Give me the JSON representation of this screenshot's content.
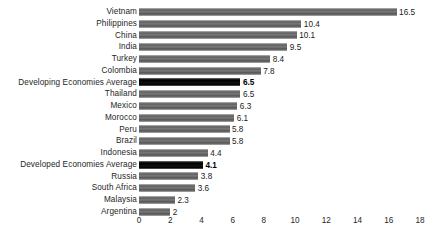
{
  "chart_data": {
    "type": "bar",
    "orientation": "horizontal",
    "title": "",
    "subtitle": "",
    "xlabel": "",
    "ylabel": "",
    "xlim": [
      0,
      18
    ],
    "xticks": [
      0,
      2,
      4,
      6,
      8,
      10,
      12,
      14,
      16,
      18
    ],
    "xtick_labels": [
      "0",
      "2",
      "4",
      "6",
      "8",
      "10",
      "12",
      "14",
      "16",
      "18"
    ],
    "grid": false,
    "legend": null,
    "categories": [
      "Vietnam",
      "Philippines",
      "China",
      "India",
      "Turkey",
      "Colombia",
      "Developing Economies Average",
      "Thailand",
      "Mexico",
      "Morocco",
      "Peru",
      "Brazil",
      "Indonesia",
      "Developed Economies Average",
      "Russia",
      "South Africa",
      "Malaysia",
      "Argentina"
    ],
    "values": [
      16.5,
      10.4,
      10.1,
      9.5,
      8.4,
      7.8,
      6.5,
      6.5,
      6.3,
      6.1,
      5.8,
      5.8,
      4.4,
      4.1,
      3.8,
      3.6,
      2.3,
      2
    ],
    "value_labels": [
      "16.5",
      "10.4",
      "10.1",
      "9.5",
      "8.4",
      "7.8",
      "6.5",
      "6.5",
      "6.3",
      "6.1",
      "5.8",
      "5.8",
      "4.4",
      "4.1",
      "3.8",
      "3.6",
      "2.3",
      "2"
    ],
    "highlighted": [
      false,
      false,
      false,
      false,
      false,
      false,
      true,
      false,
      false,
      false,
      false,
      false,
      false,
      true,
      false,
      false,
      false,
      false
    ],
    "colors": {
      "bar": "#6e6e6e",
      "bar_highlight": "#000000",
      "text": "#262626",
      "background": "#ffffff"
    }
  }
}
